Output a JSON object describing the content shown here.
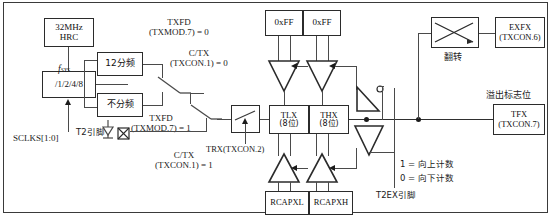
{
  "diagram": {
    "clock": {
      "source_box": {
        "line1": "32MHz",
        "line2": "HRC"
      },
      "prescaler_box": "/1/2/4/8",
      "fsys_label": "f",
      "fsys_sub": "SYS",
      "sclks_label": "SCLKS[1:0]"
    },
    "dividers": {
      "div12": "12分频",
      "nodiv": "不分频"
    },
    "selectors": {
      "txfd_0_line1": "TXFD",
      "txfd_0_line2": "(TXMOD.7) = 0",
      "txfd_1_line1": "TXFD",
      "txfd_1_line2": "(TXMOD.7) = 1",
      "ctx_0_line1": "C/TX",
      "ctx_0_line2": "(TXCON.1) = 0",
      "ctx_1_line1": "C/TX",
      "ctx_1_line2": "(TXCON.1) = 1",
      "t2_pin": "T2引脚",
      "trx_label": "TRX(TXCON.2)"
    },
    "reload": {
      "ff_left": "0xFF",
      "ff_right": "0xFF"
    },
    "counters": {
      "tlx_line1": "TLX",
      "tlx_line2": "(8位)",
      "thx_line1": "THX",
      "thx_line2": "(8位)"
    },
    "capture": {
      "rcapxl": "RCAPXL",
      "rcapxh": "RCAPXH"
    },
    "direction": {
      "up": "1 = 向上计数",
      "down": "0 = 向下计数",
      "t2ex_pin": "T2EX引脚"
    },
    "toggle": {
      "caption": "翻转",
      "exfx_line1": "EXFX",
      "exfx_line2": "(TXCON.6)"
    },
    "overflow": {
      "caption": "溢出标志位",
      "tfx_line1": "TFX",
      "tfx_line2": "(TXCON.7)"
    },
    "colors": {
      "line": "#4a4a4a",
      "box_border": "#2b2b2b",
      "text": "#1a1a1a",
      "background": "#ffffff"
    }
  }
}
